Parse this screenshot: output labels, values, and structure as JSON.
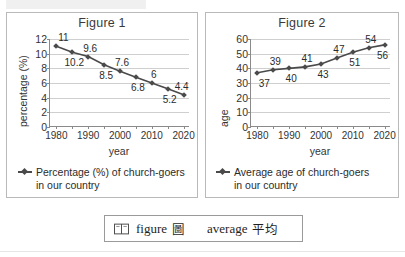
{
  "figures": [
    {
      "title": "Figure 1",
      "ylabel": "percentage (%)",
      "xlabel": "year",
      "legend_line1": "Percentage (%) of church-goers",
      "legend_line2": "in our country"
    },
    {
      "title": "Figure 2",
      "ylabel": "age",
      "xlabel": "year",
      "legend_line1": "Average age of church-goers",
      "legend_line2": "in our country"
    }
  ],
  "vocabulary": {
    "icon": "open-book-icon",
    "word1_en": "figure",
    "word1_zh": "圖",
    "word2_en": "average",
    "word2_zh": "平均"
  },
  "colors": {
    "series": "#4a4a4a",
    "grid": "#cfcfcf",
    "axis": "#8a8a8a",
    "panel_border": "#b9b9b9",
    "text": "#2b2b2b"
  },
  "chart_data": [
    {
      "type": "line",
      "title": "Figure 1",
      "xlabel": "year",
      "ylabel": "percentage (%)",
      "x": [
        1980,
        1985,
        1990,
        1995,
        2000,
        2005,
        2010,
        2015,
        2020
      ],
      "values": [
        11,
        10.2,
        9.6,
        8.5,
        7.6,
        6.8,
        6,
        5.2,
        4.4
      ],
      "point_labels": [
        "11",
        "10.2",
        "9.6",
        "8.5",
        "7.6",
        "6.8",
        "6",
        "5.2",
        "4.4"
      ],
      "label_side": [
        "above",
        "below",
        "above",
        "below",
        "above",
        "below",
        "above",
        "below",
        "above"
      ],
      "xlim": [
        1978,
        2022
      ],
      "ylim": [
        0,
        12
      ],
      "yticks": [
        0,
        2,
        4,
        6,
        8,
        10,
        12
      ],
      "xticks_labeled": [
        1980,
        1990,
        2000,
        2010,
        2020
      ],
      "xticks_minor": [
        1985,
        1995,
        2005,
        2015
      ],
      "grid": true,
      "legend": [
        "Percentage (%) of church-goers in our country"
      ],
      "legend_position": "below-chart"
    },
    {
      "type": "line",
      "title": "Figure 2",
      "xlabel": "year",
      "ylabel": "age",
      "x": [
        1980,
        1985,
        1990,
        1995,
        2000,
        2005,
        2010,
        2015,
        2020
      ],
      "values": [
        37,
        39,
        40,
        41,
        43,
        47,
        51,
        54,
        56
      ],
      "point_labels": [
        "37",
        "39",
        "40",
        "41",
        "43",
        "47",
        "51",
        "54",
        "56"
      ],
      "label_side": [
        "below",
        "above",
        "below",
        "above",
        "below",
        "above",
        "below",
        "above",
        "below"
      ],
      "xlim": [
        1978,
        2022
      ],
      "ylim": [
        0,
        60
      ],
      "yticks": [
        0,
        10,
        20,
        30,
        40,
        50,
        60
      ],
      "xticks_labeled": [
        1980,
        1990,
        2000,
        2010,
        2020
      ],
      "xticks_minor": [
        1985,
        1995,
        2005,
        2015
      ],
      "grid": true,
      "legend": [
        "Average age of church-goers in our country"
      ],
      "legend_position": "below-chart"
    }
  ]
}
